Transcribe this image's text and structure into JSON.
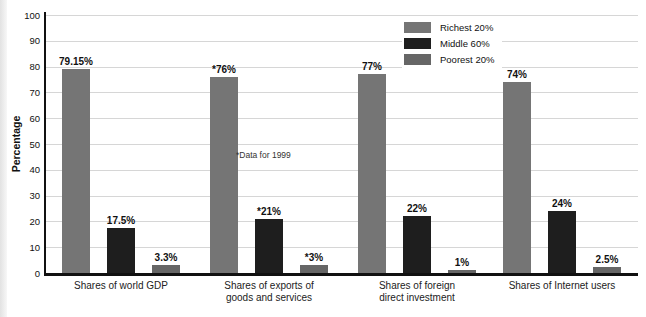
{
  "figure": {
    "background": "#ffffff",
    "axis_color": "#111111",
    "gridline_color": "#d6d6d6"
  },
  "chart_data": {
    "type": "bar",
    "title": "",
    "ylabel": "Percentage",
    "ylim": [
      0,
      100
    ],
    "ytick_step": 10,
    "yticks": [
      0,
      10,
      20,
      30,
      40,
      50,
      60,
      70,
      80,
      90,
      100
    ],
    "grid": "horizontal",
    "legend_position": "top-center",
    "annotation": "*Data for 1999",
    "categories": [
      {
        "lines": [
          "Shares of world GDP"
        ]
      },
      {
        "lines": [
          "Shares of exports of",
          "goods and services"
        ]
      },
      {
        "lines": [
          "Shares of foreign",
          "direct investment"
        ]
      },
      {
        "lines": [
          "Shares of Internet users"
        ]
      }
    ],
    "series": [
      {
        "name": "Richest 20%",
        "color": "#757575",
        "values": [
          79.15,
          76,
          77,
          74
        ],
        "labels": [
          "79.15%",
          "*76%",
          "77%",
          "74%"
        ]
      },
      {
        "name": "Middle 60%",
        "color": "#1e1e1e",
        "values": [
          17.5,
          21,
          22,
          24
        ],
        "labels": [
          "17.5%",
          "*21%",
          "22%",
          "24%"
        ]
      },
      {
        "name": "Poorest 20%",
        "color": "#666666",
        "values": [
          3.3,
          3,
          1,
          2.5
        ],
        "labels": [
          "3.3%",
          "*3%",
          "1%",
          "2.5%"
        ]
      }
    ]
  }
}
